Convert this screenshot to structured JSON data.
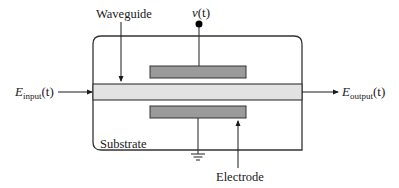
{
  "diagram": {
    "labels": {
      "waveguide": "Waveguide",
      "voltage_var": "v",
      "voltage_arg": "(t)",
      "input_E": "E",
      "input_sub": "input",
      "input_arg": "(t)",
      "output_E": "E",
      "output_sub": "output",
      "output_arg": "(t)",
      "substrate": "Substrate",
      "electrode": "Electrode"
    },
    "components": [
      {
        "name": "substrate",
        "shape": "rounded-rectangle",
        "fill": "#ffffff",
        "stroke": "#333333"
      },
      {
        "name": "waveguide",
        "shape": "rectangle",
        "fill": "#e2e2e2",
        "stroke": "#333333"
      },
      {
        "name": "top-electrode",
        "shape": "rectangle",
        "fill": "#9a9a9a",
        "stroke": "#333333"
      },
      {
        "name": "bottom-electrode",
        "shape": "rectangle",
        "fill": "#9a9a9a",
        "stroke": "#333333"
      },
      {
        "name": "voltage-terminal",
        "shape": "dot",
        "fill": "#000000"
      },
      {
        "name": "ground",
        "shape": "ground-symbol"
      }
    ],
    "connections": [
      {
        "from": "input_E",
        "to": "waveguide",
        "type": "arrow"
      },
      {
        "from": "waveguide",
        "to": "output_E",
        "type": "arrow"
      },
      {
        "from": "voltage-terminal",
        "to": "top-electrode",
        "type": "line"
      },
      {
        "from": "bottom-electrode",
        "to": "ground",
        "type": "line"
      },
      {
        "from": "waveguide-label",
        "to": "waveguide",
        "type": "arrow"
      },
      {
        "from": "electrode-label",
        "to": "bottom-electrode",
        "type": "arrow"
      }
    ]
  }
}
